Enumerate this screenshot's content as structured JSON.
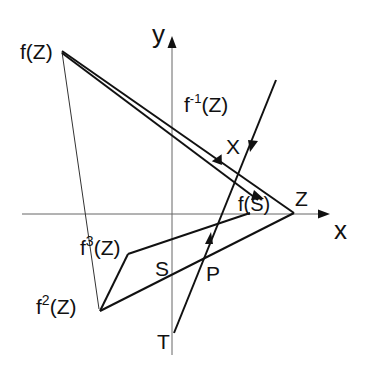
{
  "diagram": {
    "axes": {
      "x_label": "x",
      "y_label": "y"
    },
    "points": {
      "fZ": {
        "label": "f(Z)",
        "x": 62,
        "y": 52
      },
      "Z": {
        "label": "Z",
        "x": 294,
        "y": 213
      },
      "f2Z": {
        "label_base": "f",
        "label_sup": "2",
        "label_tail": "(Z)",
        "x": 100,
        "y": 311
      },
      "f3Z": {
        "label_base": "f",
        "label_sup": "3",
        "label_tail": "(Z)",
        "x": 128,
        "y": 254
      },
      "fS": {
        "label": "f(S)",
        "x": 250,
        "y": 214
      },
      "S": {
        "label": "S",
        "x": 172,
        "y": 266
      },
      "P": {
        "label": "P",
        "x": 204,
        "y": 250
      },
      "T": {
        "label": "T",
        "x": 174,
        "y": 333
      },
      "X": {
        "label": "X"
      },
      "finvZ": {
        "label_base": "f",
        "label_sup": "-1",
        "label_tail": "(Z)"
      }
    },
    "colors": {
      "line": "#111111",
      "axis": "#666666"
    }
  }
}
